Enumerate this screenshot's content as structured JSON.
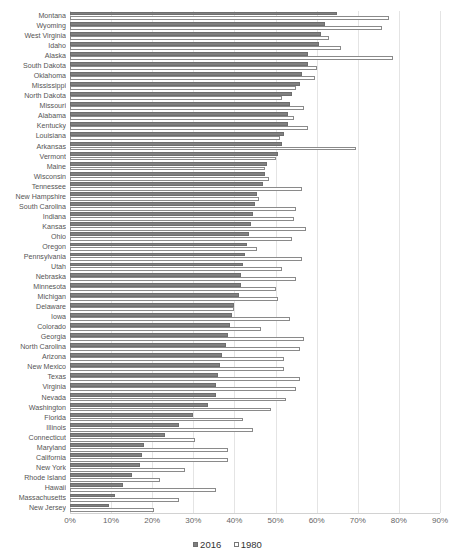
{
  "chart_data": {
    "type": "bar",
    "orientation": "horizontal",
    "title": "",
    "xlabel": "",
    "ylabel": "",
    "xlim": [
      0,
      0.9
    ],
    "xtick_labels": [
      "0%",
      "10%",
      "20%",
      "30%",
      "40%",
      "50%",
      "60%",
      "70%",
      "80%",
      "90%"
    ],
    "xtick_values": [
      0,
      10,
      20,
      30,
      40,
      50,
      60,
      70,
      80,
      90
    ],
    "grid": true,
    "legend_position": "bottom",
    "categories": [
      "Montana",
      "Wyoming",
      "West Virginia",
      "Idaho",
      "Alaska",
      "South Dakota",
      "Oklahoma",
      "Mississippi",
      "North Dakota",
      "Missouri",
      "Alabama",
      "Kentucky",
      "Louisiana",
      "Arkansas",
      "Vermont",
      "Maine",
      "Wisconsin",
      "Tennessee",
      "New Hampshire",
      "South Carolina",
      "Indiana",
      "Kansas",
      "Ohio",
      "Oregon",
      "Pennsylvania",
      "Utah",
      "Nebraska",
      "Minnesota",
      "Michigan",
      "Delaware",
      "Iowa",
      "Colorado",
      "Georgia",
      "North Carolina",
      "Arizona",
      "New Mexico",
      "Texas",
      "Virginia",
      "Nevada",
      "Washington",
      "Florida",
      "Illinois",
      "Connecticut",
      "Maryland",
      "California",
      "New York",
      "Rhode Island",
      "Hawaii",
      "Massachusetts",
      "New Jersey"
    ],
    "series": [
      {
        "name": "2016",
        "color": "#808080",
        "values": [
          65.0,
          62.0,
          61.0,
          60.5,
          58.0,
          58.0,
          56.5,
          56.0,
          54.0,
          53.5,
          53.0,
          53.0,
          52.0,
          51.5,
          50.5,
          48.0,
          47.5,
          47.0,
          45.5,
          45.0,
          44.5,
          44.0,
          43.5,
          43.0,
          42.5,
          42.0,
          41.5,
          41.5,
          41.0,
          40.0,
          39.5,
          39.0,
          38.5,
          38.0,
          37.0,
          36.5,
          36.0,
          35.5,
          35.5,
          33.5,
          30.0,
          26.5,
          23.0,
          18.0,
          17.5,
          17.0,
          15.0,
          13.0,
          11.0,
          9.5
        ]
      },
      {
        "name": "1980",
        "color": "#ffffff",
        "values": [
          77.5,
          76.0,
          63.0,
          66.0,
          78.5,
          60.0,
          59.5,
          55.0,
          51.5,
          57.0,
          54.5,
          58.0,
          51.0,
          69.5,
          50.0,
          47.5,
          48.5,
          56.5,
          46.0,
          55.0,
          54.5,
          57.5,
          54.0,
          45.5,
          56.5,
          51.5,
          55.0,
          50.0,
          50.5,
          40.0,
          53.5,
          46.5,
          57.0,
          56.0,
          52.0,
          52.0,
          56.0,
          55.0,
          52.5,
          49.0,
          42.0,
          44.5,
          30.5,
          38.5,
          38.5,
          28.0,
          22.0,
          35.5,
          26.5,
          20.5
        ]
      }
    ]
  },
  "legend": {
    "items": [
      {
        "label": "2016",
        "style": "filled"
      },
      {
        "label": "1980",
        "style": "outlined"
      }
    ]
  }
}
